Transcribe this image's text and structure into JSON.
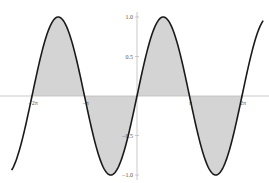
{
  "chart_data": {
    "type": "area",
    "title": "",
    "xlabel": "",
    "ylabel": "",
    "function": "sin(x)",
    "x_range": [
      -7.5,
      7.55
    ],
    "shaded_interval": [
      -6.2832,
      6.2832
    ],
    "xlim": [
      -7.5,
      7.55
    ],
    "ylim": [
      -1.05,
      1.05
    ],
    "grid": false,
    "legend": null,
    "x_ticks": [
      {
        "value": -6.2832,
        "label": "-2π"
      },
      {
        "value": -3.1416,
        "label": "-π"
      },
      {
        "value": 3.1416,
        "label": "π"
      },
      {
        "value": 6.2832,
        "label": "2π"
      }
    ],
    "y_ticks": [
      {
        "value": 1.0,
        "label": "1.0"
      },
      {
        "value": 0.5,
        "label": "0.5"
      },
      {
        "value": -0.5,
        "label": "-0.5"
      },
      {
        "value": -1.0,
        "label": "-1.0"
      }
    ],
    "series": [
      {
        "name": "sin(x)",
        "color": "#1a1a1a",
        "fill": "#d4d4d4"
      }
    ]
  },
  "colors": {
    "curve": "#1a1a1a",
    "fill": "#d4d4d4",
    "axis": "#bbbbbb",
    "tick_label": "#555555"
  }
}
